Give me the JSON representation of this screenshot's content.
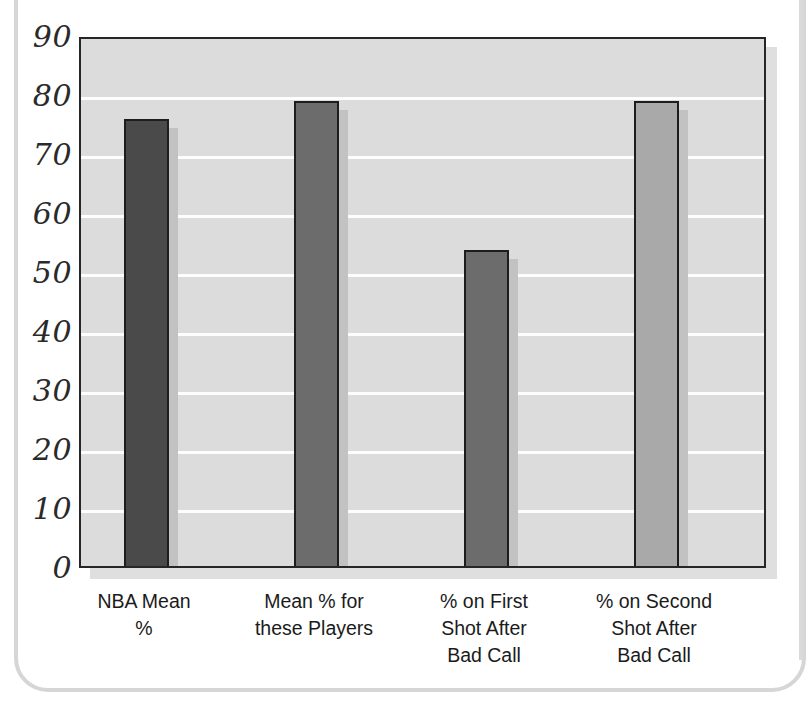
{
  "chart_data": {
    "type": "bar",
    "title": "",
    "subtitle": "",
    "xlabel": "",
    "ylabel": "",
    "categories": [
      "NBA Mean\n%",
      "Mean % for\nthese Players",
      "% on First\nShot After\nBad Call",
      "% on Second\nShot After\nBad Call"
    ],
    "values": [
      76.5,
      79.5,
      54.2,
      79.5
    ],
    "ylim": [
      0,
      90
    ],
    "ytick_step": 10,
    "yticks": [
      90,
      80,
      70,
      60,
      50,
      40,
      30,
      20,
      10,
      0
    ],
    "ytick_labels": [
      "90",
      "80",
      "70",
      "60",
      "50",
      "40",
      "30",
      "20",
      "10",
      "0"
    ],
    "grid": true,
    "grid_axis": "y",
    "grid_color": "#fdfdfd",
    "legend": false,
    "legend_position": "none",
    "plot_background": "#dcdcdc",
    "bar_colors": [
      "#4a4a4a",
      "#6c6c6c",
      "#6c6c6c",
      "#a9a9a9"
    ],
    "bar_edge_color": "#1d1d1d",
    "bar_shadow_color": "#c2c2c2",
    "series": [
      {
        "name": "Free throw percentage",
        "values": [
          76.5,
          79.5,
          54.2,
          79.5
        ]
      }
    ],
    "bars": [
      {
        "label": "NBA Mean\n%",
        "value": 76.5,
        "color": "#4a4a4a"
      },
      {
        "label": "Mean % for\nthese Players",
        "value": 79.5,
        "color": "#6c6c6c"
      },
      {
        "label": "% on First\nShot After\nBad Call",
        "value": 54.2,
        "color": "#6c6c6c"
      },
      {
        "label": "% on Second\nShot After\nBad Call",
        "value": 79.5,
        "color": "#a9a9a9"
      }
    ]
  },
  "axis": {
    "y_ticks": [
      {
        "label": "90"
      },
      {
        "label": "80"
      },
      {
        "label": "70"
      },
      {
        "label": "60"
      },
      {
        "label": "50"
      },
      {
        "label": "40"
      },
      {
        "label": "30"
      },
      {
        "label": "20"
      },
      {
        "label": "10"
      },
      {
        "label": "0"
      }
    ],
    "x_ticks": [
      {
        "label": "NBA Mean\n%"
      },
      {
        "label": "Mean % for\nthese Players"
      },
      {
        "label": "% on First\nShot After\nBad Call"
      },
      {
        "label": "% on Second\nShot After\nBad Call"
      }
    ]
  }
}
